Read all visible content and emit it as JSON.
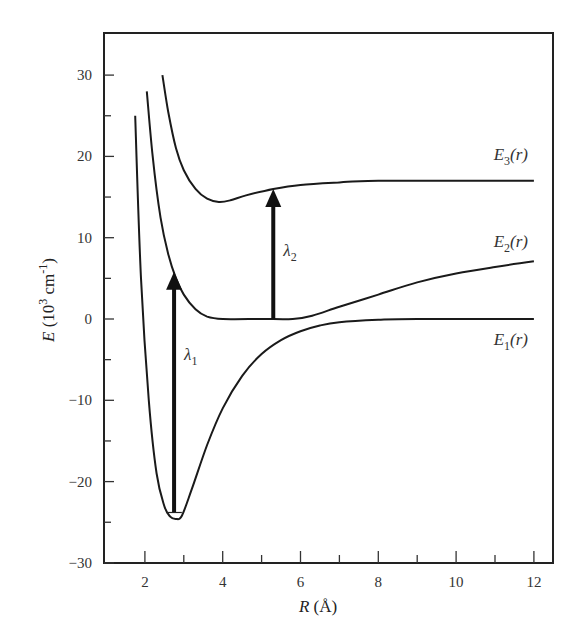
{
  "chart_data": {
    "type": "line",
    "title": "",
    "xlabel": "R (Å)",
    "ylabel": "E (10^3 cm^-1)",
    "xlim": [
      1,
      12.5
    ],
    "ylim": [
      -30,
      35
    ],
    "xticks_major": [
      2,
      4,
      6,
      8,
      10,
      12
    ],
    "xticks_minor": [
      3,
      5,
      7,
      9,
      11
    ],
    "yticks_major": [
      -30,
      -20,
      -10,
      0,
      10,
      20,
      30
    ],
    "yticks_minor": [
      -25,
      -15,
      -5,
      5,
      15,
      25
    ],
    "grid": false,
    "legend": "none (inline curve labels)",
    "series": [
      {
        "name": "E1(r)",
        "label": "E",
        "label_sub": "1",
        "label_suffix": "(r)",
        "points": [
          [
            1.75,
            25
          ],
          [
            1.9,
            5
          ],
          [
            2.1,
            -10
          ],
          [
            2.3,
            -19
          ],
          [
            2.5,
            -23
          ],
          [
            2.65,
            -24.3
          ],
          [
            2.8,
            -24.6
          ],
          [
            2.95,
            -24.2
          ],
          [
            3.2,
            -21
          ],
          [
            3.6,
            -15.5
          ],
          [
            4.0,
            -11
          ],
          [
            4.5,
            -7
          ],
          [
            5.0,
            -4.3
          ],
          [
            5.5,
            -2.6
          ],
          [
            6.0,
            -1.5
          ],
          [
            6.5,
            -0.8
          ],
          [
            7.0,
            -0.4
          ],
          [
            8.0,
            -0.1
          ],
          [
            9.0,
            0
          ],
          [
            12.0,
            0
          ]
        ]
      },
      {
        "name": "E2(r)",
        "label": "E",
        "label_sub": "2",
        "label_suffix": "(r)",
        "points": [
          [
            2.05,
            28
          ],
          [
            2.2,
            20
          ],
          [
            2.4,
            12.5
          ],
          [
            2.6,
            8
          ],
          [
            2.8,
            5
          ],
          [
            3.0,
            3
          ],
          [
            3.3,
            1.2
          ],
          [
            3.6,
            0.3
          ],
          [
            4.0,
            0
          ],
          [
            5.0,
            0
          ],
          [
            5.8,
            0
          ],
          [
            6.3,
            0.4
          ],
          [
            7.0,
            1.5
          ],
          [
            8.0,
            3
          ],
          [
            9.0,
            4.5
          ],
          [
            10.0,
            5.6
          ],
          [
            11.0,
            6.4
          ],
          [
            12.0,
            7.1
          ]
        ]
      },
      {
        "name": "E3(r)",
        "label": "E",
        "label_sub": "3",
        "label_suffix": "(r)",
        "points": [
          [
            2.45,
            30
          ],
          [
            2.6,
            25.5
          ],
          [
            2.8,
            21
          ],
          [
            3.0,
            18.3
          ],
          [
            3.3,
            16
          ],
          [
            3.6,
            14.8
          ],
          [
            3.9,
            14.4
          ],
          [
            4.2,
            14.6
          ],
          [
            4.6,
            15.2
          ],
          [
            5.3,
            16
          ],
          [
            6.0,
            16.5
          ],
          [
            7.0,
            16.8
          ],
          [
            8.0,
            17
          ],
          [
            12.0,
            17
          ]
        ]
      }
    ],
    "annotations": [
      {
        "type": "arrow",
        "name": "lambda1",
        "label": "λ",
        "label_sub": "1",
        "x": 2.75,
        "y_from": -23.8,
        "y_to": 5.8
      },
      {
        "type": "arrow",
        "name": "lambda2",
        "label": "λ",
        "label_sub": "2",
        "x": 5.3,
        "y_from": 0,
        "y_to": 16
      },
      {
        "type": "small-well-marker",
        "x_range": [
          2.55,
          2.95
        ],
        "y": -23.8
      }
    ]
  },
  "axes": {
    "x_title_main": "R",
    "x_title_unit": " (Å)",
    "y_title_main": "E",
    "y_title_unit": " (10",
    "y_title_exp": "3",
    "y_title_unit2": " cm",
    "y_title_exp2": "-1",
    "y_title_close": ")"
  }
}
